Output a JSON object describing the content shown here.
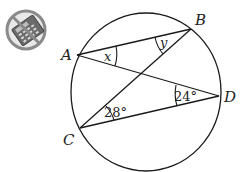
{
  "diagram": {
    "type": "circle-inscribed-angles",
    "icon": "no-calculator-icon",
    "points": {
      "A": {
        "label": "A",
        "x": 77,
        "y": 55
      },
      "B": {
        "label": "B",
        "x": 191,
        "y": 29
      },
      "C": {
        "label": "C",
        "x": 80,
        "y": 128
      },
      "D": {
        "label": "D",
        "x": 219,
        "y": 96
      }
    },
    "segments": [
      "AB",
      "AD",
      "BC",
      "CD"
    ],
    "angles": {
      "x": {
        "label": "x",
        "vertex": "A"
      },
      "y": {
        "label": "y",
        "vertex": "B"
      },
      "c": {
        "label": "28°",
        "vertex": "C"
      },
      "d": {
        "label": "24°",
        "vertex": "D"
      }
    },
    "colors": {
      "stroke": "#1a1a1a",
      "icon_gray": "#6b6b6b",
      "icon_ring": "#8a8a8a"
    }
  }
}
